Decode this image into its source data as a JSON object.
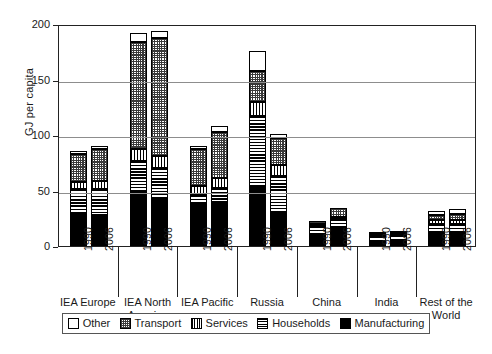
{
  "chart_data": {
    "type": "bar",
    "stacked": true,
    "title": "",
    "xlabel": "",
    "ylabel": "GJ per capita",
    "ylim": [
      0,
      200
    ],
    "yticks": [
      0,
      50,
      100,
      150,
      200
    ],
    "grid": true,
    "legend_position": "bottom",
    "legend_entries": [
      "Other",
      "Transport",
      "Services",
      "Households",
      "Manufacturing"
    ],
    "stack_order_bottom_to_top": [
      "Manufacturing",
      "Households",
      "Services",
      "Transport",
      "Other"
    ],
    "groups": [
      {
        "name": "IEA Europe",
        "years": [
          "1990",
          "2006"
        ]
      },
      {
        "name": "IEA North\nAmerica",
        "years": [
          "1990",
          "2006"
        ]
      },
      {
        "name": "IEA Pacific",
        "years": [
          "1990",
          "2006"
        ]
      },
      {
        "name": "Russia",
        "years": [
          "1990",
          "2006"
        ]
      },
      {
        "name": "China",
        "years": [
          "1990",
          "2006"
        ]
      },
      {
        "name": "India",
        "years": [
          "1990",
          "2006"
        ]
      },
      {
        "name": "Rest of the\nWorld",
        "years": [
          "1990",
          "2006"
        ]
      }
    ],
    "categories": [
      "IEA Europe 1990",
      "IEA Europe 2006",
      "IEA North America 1990",
      "IEA North America 2006",
      "IEA Pacific 1990",
      "IEA Pacific 2006",
      "Russia 1990",
      "Russia 2006",
      "China 1990",
      "China 2006",
      "India 1990",
      "India 2006",
      "Rest of the World 1990",
      "Rest of the World 2006"
    ],
    "series": [
      {
        "name": "Manufacturing",
        "values": [
          30,
          28,
          49,
          43,
          37,
          40,
          54,
          30,
          9,
          16,
          4,
          5,
          11,
          12
        ]
      },
      {
        "name": "Households",
        "values": [
          21,
          23,
          28,
          27,
          9,
          12,
          63,
          33,
          9,
          8,
          5,
          5,
          9,
          8
        ]
      },
      {
        "name": "Services",
        "values": [
          7,
          8,
          10,
          11,
          8,
          9,
          13,
          10,
          1,
          2,
          1,
          1,
          3,
          3
        ]
      },
      {
        "name": "Transport",
        "values": [
          25,
          28,
          97,
          106,
          33,
          42,
          28,
          24,
          3,
          8,
          2,
          2,
          5,
          6
        ]
      },
      {
        "name": "Other",
        "values": [
          3,
          3,
          8,
          7,
          3,
          5,
          18,
          4,
          0,
          0,
          0,
          0,
          4,
          4
        ]
      }
    ],
    "bar_totals": [
      86,
      90,
      192,
      194,
      90,
      108,
      176,
      101,
      22,
      34,
      12,
      13,
      32,
      33
    ]
  },
  "axis": {
    "y_tick_labels": [
      "0",
      "50",
      "100",
      "150",
      "200"
    ],
    "y_axis_title": "GJ per capita"
  },
  "legend": {
    "items": [
      {
        "label": "Other",
        "pattern": "white-solid"
      },
      {
        "label": "Transport",
        "pattern": "cross-hatch-dark"
      },
      {
        "label": "Services",
        "pattern": "vertical-lines"
      },
      {
        "label": "Households",
        "pattern": "horizontal-lines"
      },
      {
        "label": "Manufacturing",
        "pattern": "black-solid"
      }
    ]
  },
  "colors": {
    "axis": "#222222",
    "grid": "#8d8d8d",
    "background": "#ffffff",
    "ink": "#000000"
  }
}
